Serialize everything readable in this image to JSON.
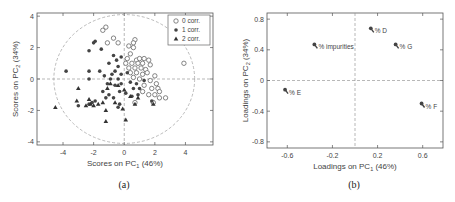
{
  "chart_data": [
    {
      "type": "scatter",
      "panel_label": "(a)",
      "title": "",
      "xlabel": "Scores on PC1 (46%)",
      "ylabel": "Scores on PC2 (34%)",
      "xlim": [
        -5.7,
        5.8
      ],
      "ylim": [
        -4.2,
        4.2
      ],
      "xticks": [
        -4,
        -2,
        0,
        2,
        4
      ],
      "yticks": [
        -4,
        -2,
        0,
        2,
        4
      ],
      "grid": false,
      "reference_lines": {
        "x": 0,
        "y": 0,
        "style": "dashed"
      },
      "confidence_ellipse": {
        "cx": 0,
        "cy": 0,
        "rx": 4.6,
        "ry": 4.1,
        "style": "dashed"
      },
      "legend_position": "upper right",
      "series": [
        {
          "name": "0 corr.",
          "marker": "open-circle",
          "points": [
            [
              -1.2,
              3.3
            ],
            [
              -1.4,
              3.1
            ],
            [
              -0.7,
              2.6
            ],
            [
              -1.1,
              2.3
            ],
            [
              -0.4,
              2.3
            ],
            [
              0.7,
              2.5
            ],
            [
              0.6,
              2.3
            ],
            [
              0.3,
              2.1
            ],
            [
              0.6,
              2.0
            ],
            [
              0.4,
              1.6
            ],
            [
              0.2,
              1.3
            ],
            [
              0.8,
              1.2
            ],
            [
              1.0,
              1.3
            ],
            [
              1.3,
              1.3
            ],
            [
              1.6,
              1.2
            ],
            [
              0.1,
              1.0
            ],
            [
              0.5,
              1.0
            ],
            [
              0.9,
              1.0
            ],
            [
              1.2,
              1.0
            ],
            [
              1.7,
              0.9
            ],
            [
              0.3,
              0.7
            ],
            [
              0.7,
              0.7
            ],
            [
              1.1,
              0.7
            ],
            [
              1.4,
              0.6
            ],
            [
              0.4,
              0.4
            ],
            [
              0.8,
              0.4
            ],
            [
              1.2,
              0.3
            ],
            [
              1.5,
              0.4
            ],
            [
              2.0,
              0.2
            ],
            [
              0.6,
              0.1
            ],
            [
              1.0,
              0.0
            ],
            [
              1.7,
              -0.1
            ],
            [
              2.1,
              -0.3
            ],
            [
              1.3,
              -0.4
            ],
            [
              1.8,
              -0.6
            ],
            [
              2.2,
              -0.6
            ],
            [
              2.3,
              -0.8
            ],
            [
              1.2,
              -0.8
            ],
            [
              1.6,
              -1.0
            ],
            [
              2.0,
              -1.0
            ],
            [
              2.3,
              -1.2
            ],
            [
              2.7,
              -1.2
            ],
            [
              1.9,
              -1.5
            ],
            [
              0.7,
              -1.5
            ],
            [
              3.9,
              1.0
            ]
          ]
        },
        {
          "name": "1 corr.",
          "marker": "filled-circle",
          "points": [
            [
              -1.9,
              2.4
            ],
            [
              -2.0,
              2.3
            ],
            [
              -2.3,
              1.8
            ],
            [
              -1.5,
              1.9
            ],
            [
              -0.7,
              1.5
            ],
            [
              -0.5,
              1.2
            ],
            [
              -0.2,
              1.4
            ],
            [
              -1.0,
              1.0
            ],
            [
              -0.4,
              0.8
            ],
            [
              -0.6,
              0.5
            ],
            [
              -1.6,
              0.5
            ],
            [
              -2.3,
              0.5
            ],
            [
              -3.8,
              0.5
            ],
            [
              -2.3,
              0.0
            ],
            [
              -1.3,
              0.2
            ],
            [
              -0.8,
              0.3
            ],
            [
              -0.2,
              0.3
            ],
            [
              0.2,
              0.4
            ],
            [
              -0.4,
              0.0
            ],
            [
              -0.9,
              0.0
            ],
            [
              -0.2,
              -0.3
            ],
            [
              0.4,
              -0.2
            ],
            [
              0.8,
              -0.3
            ],
            [
              -0.6,
              -0.4
            ],
            [
              -1.1,
              -0.3
            ],
            [
              0.6,
              -0.6
            ],
            [
              1.0,
              -0.6
            ],
            [
              -1.4,
              -0.8
            ],
            [
              -0.3,
              -0.8
            ],
            [
              0.1,
              -0.9
            ],
            [
              -1.0,
              -1.0
            ],
            [
              0.5,
              -1.1
            ],
            [
              -0.7,
              -1.2
            ],
            [
              -1.2,
              -1.2
            ],
            [
              -2.1,
              -1.5
            ],
            [
              -1.9,
              -1.4
            ],
            [
              -3.0,
              -1.7
            ],
            [
              -2.3,
              -1.6
            ],
            [
              -0.4,
              -1.8
            ],
            [
              1.8,
              -1.4
            ],
            [
              -0.3,
              -1.6
            ],
            [
              1.3,
              -0.1
            ],
            [
              0.9,
              -1.0
            ]
          ]
        },
        {
          "name": "2 corr.",
          "marker": "filled-triangle",
          "points": [
            [
              -4.5,
              -1.8
            ],
            [
              -3.0,
              -0.6
            ],
            [
              -3.1,
              -1.4
            ],
            [
              -2.3,
              -1.3
            ],
            [
              -2.5,
              -1.7
            ],
            [
              -2.2,
              -1.6
            ],
            [
              -2.0,
              -1.7
            ],
            [
              -1.7,
              -1.6
            ],
            [
              -1.4,
              -1.5
            ],
            [
              -1.1,
              -0.6
            ],
            [
              -1.2,
              -2.0
            ],
            [
              -1.2,
              -2.7
            ],
            [
              0.1,
              -2.6
            ],
            [
              -0.1,
              -1.9
            ],
            [
              -0.6,
              -1.5
            ],
            [
              -0.4,
              -0.4
            ],
            [
              0.0,
              -0.7
            ],
            [
              0.4,
              -1.1
            ],
            [
              0.7,
              -1.6
            ],
            [
              1.9,
              -1.6
            ],
            [
              -0.9,
              -0.3
            ],
            [
              0.9,
              -1.2
            ]
          ]
        }
      ]
    },
    {
      "type": "scatter",
      "panel_label": "(b)",
      "title": "",
      "xlabel": "Loadings on PC1 (46%)",
      "ylabel": "Loadings on PC2 (34%)",
      "xlim": [
        -0.78,
        0.78
      ],
      "ylim": [
        -0.88,
        0.88
      ],
      "xticks": [
        -0.6,
        -0.2,
        0.2,
        0.6
      ],
      "yticks": [
        -0.8,
        -0.4,
        0,
        0.4,
        0.8
      ],
      "grid": false,
      "reference_lines": {
        "x": 0,
        "y": 0,
        "style": "dashed"
      },
      "points": [
        {
          "label": "% D",
          "x": 0.14,
          "y": 0.68
        },
        {
          "label": "% G",
          "x": 0.36,
          "y": 0.47
        },
        {
          "label": "% impurities",
          "x": -0.36,
          "y": 0.47
        },
        {
          "label": "% E",
          "x": -0.62,
          "y": -0.12
        },
        {
          "label": "% F",
          "x": 0.59,
          "y": -0.3
        }
      ]
    }
  ],
  "figure": {
    "panel_a_label": "(a)",
    "panel_b_label": "(b)"
  }
}
